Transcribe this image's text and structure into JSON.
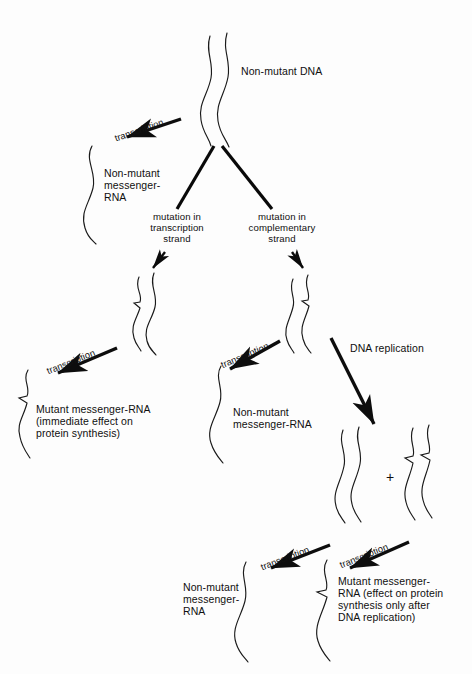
{
  "figure": {
    "background_color": "#fdfdfd",
    "ink_color": "#111111"
  },
  "nodes": {
    "top_dna": {
      "label": "Non-mutant DNA",
      "kind": "dna-duplex",
      "mutated": false
    },
    "top_left_rna": {
      "label": "Non-mutant\nmessenger-\nRNA",
      "kind": "rna-strand",
      "mutated": false
    },
    "left_mutant_dna": {
      "label": "",
      "kind": "dna-duplex",
      "mutated": true
    },
    "right_mutant_dna": {
      "label": "",
      "kind": "dna-duplex",
      "mutated": true
    },
    "left_mutant_rna": {
      "label": "Mutant messenger-RNA\n(immediate effect on\nprotein synthesis)",
      "kind": "rna-strand",
      "mutated": true
    },
    "mid_nonmutant_rna": {
      "label": "Non-mutant\nmessenger-RNA",
      "kind": "rna-strand",
      "mutated": false
    },
    "replicated_dna_a": {
      "label": "",
      "kind": "dna-duplex",
      "mutated": false
    },
    "replicated_dna_b": {
      "label": "",
      "kind": "dna-duplex",
      "mutated": true
    },
    "bottom_nonmutant_rna": {
      "label": "Non-mutant\nmessenger-\nRNA",
      "kind": "rna-strand",
      "mutated": false
    },
    "bottom_mutant_rna": {
      "label": "Mutant messenger-\nRNA (effect on protein\nsynthesis only after\nDNA replication)",
      "kind": "rna-strand",
      "mutated": true
    }
  },
  "branch_labels": {
    "left_branch": "mutation in\ntranscription\nstrand",
    "right_branch": "mutation in\ncomplementary\nstrand"
  },
  "arrows": {
    "transcription_1": "transcription",
    "transcription_2": "transcription",
    "transcription_3": "transcription",
    "transcription_4": "transcription",
    "transcription_5": "transcription",
    "dna_replication": "DNA replication"
  },
  "symbols": {
    "plus": "+"
  }
}
